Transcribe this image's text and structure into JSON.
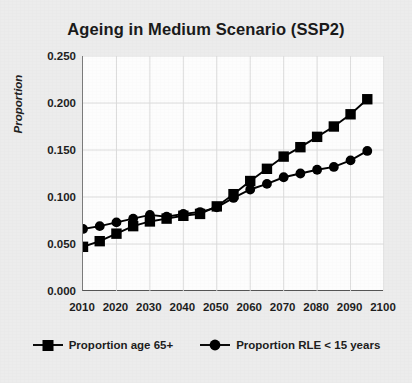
{
  "chart_data": {
    "type": "line",
    "title": "Ageing in Medium Scenario (SSP2)",
    "xlabel": "",
    "ylabel": "Proportion",
    "xlim": [
      2010,
      2100
    ],
    "ylim": [
      0.0,
      0.25
    ],
    "grid": true,
    "legend_position": "bottom",
    "x_ticks": [
      "2010",
      "2020",
      "2030",
      "2040",
      "2050",
      "2060",
      "2070",
      "2080",
      "2090",
      "2100"
    ],
    "y_ticks": [
      "0.000",
      "0.050",
      "0.100",
      "0.150",
      "0.200",
      "0.250"
    ],
    "x": [
      2010,
      2015,
      2020,
      2025,
      2030,
      2035,
      2040,
      2045,
      2050,
      2055,
      2060,
      2065,
      2070,
      2075,
      2080,
      2085,
      2090,
      2095
    ],
    "series": [
      {
        "name": "Proportion age 65+",
        "marker": "square",
        "color": "#000000",
        "values": [
          0.047,
          0.053,
          0.061,
          0.069,
          0.074,
          0.077,
          0.08,
          0.082,
          0.09,
          0.103,
          0.117,
          0.13,
          0.143,
          0.153,
          0.164,
          0.175,
          0.188,
          0.204
        ]
      },
      {
        "name": "Proportion RLE < 15 years",
        "marker": "circle",
        "color": "#000000",
        "values": [
          0.066,
          0.069,
          0.073,
          0.077,
          0.081,
          0.079,
          0.082,
          0.084,
          0.089,
          0.099,
          0.108,
          0.114,
          0.121,
          0.125,
          0.129,
          0.132,
          0.139,
          0.149
        ]
      }
    ]
  },
  "legend": {
    "entries": [
      {
        "label": "Proportion age 65+",
        "marker": "square"
      },
      {
        "label": "Proportion RLE < 15 years",
        "marker": "circle"
      }
    ]
  }
}
